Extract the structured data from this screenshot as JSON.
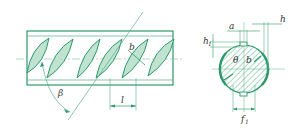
{
  "diagram": {
    "type": "rebar-rib-geometry",
    "colors": {
      "outline": "#2e9a6a",
      "rib_fill": "#bfe3d0",
      "hatch": "#2e9a6a",
      "dimension": "#58b08a",
      "centerline": "#7cc3a0",
      "text": "#333333"
    },
    "side_view": {
      "labels": {
        "beta": "β",
        "b": "b",
        "l": "l"
      },
      "rib_count": 6
    },
    "cross_section": {
      "labels": {
        "a": "a",
        "h": "h",
        "h1": "h",
        "h1_sub": "1",
        "theta": "θ",
        "b": "b",
        "f1": "f",
        "f1_sub": "1"
      }
    }
  }
}
